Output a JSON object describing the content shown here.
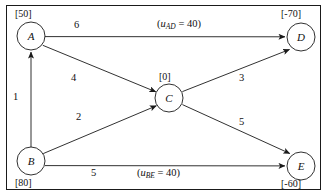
{
  "figure": {
    "border": true,
    "background": "#ffffff",
    "line_color": "#1a1a1a"
  },
  "nodes": [
    {
      "id": "A",
      "label": "A",
      "supply": "[50]",
      "supply_position": "above",
      "cx": 31,
      "cy": 36,
      "r": 14
    },
    {
      "id": "D",
      "label": "D",
      "supply": "[-70]",
      "supply_position": "above",
      "cx": 301,
      "cy": 37,
      "r": 14
    },
    {
      "id": "C",
      "label": "C",
      "supply": "[0]",
      "supply_position": "above",
      "cx": 169,
      "cy": 98,
      "r": 14
    },
    {
      "id": "B",
      "label": "B",
      "supply": "[80]",
      "supply_position": "below",
      "cx": 31,
      "cy": 161,
      "r": 14
    },
    {
      "id": "E",
      "label": "E",
      "supply": "[-60]",
      "supply_position": "below",
      "cx": 301,
      "cy": 166,
      "r": 14
    }
  ],
  "edges": [
    {
      "id": "AD",
      "from": "A",
      "to": "D",
      "cost": "6",
      "cost_x": 74,
      "cost_y": 20,
      "capacity_text": "(uAD = 40)",
      "capacity_x": 157,
      "capacity_y": 19
    },
    {
      "id": "AC",
      "from": "A",
      "to": "C",
      "cost": "4",
      "cost_x": 71,
      "cost_y": 73,
      "capacity_text": null
    },
    {
      "id": "BA",
      "from": "B",
      "to": "A",
      "cost": "1",
      "cost_x": 13,
      "cost_y": 92,
      "capacity_text": null
    },
    {
      "id": "BC",
      "from": "B",
      "to": "C",
      "cost": "2",
      "cost_x": 76,
      "cost_y": 112,
      "capacity_text": null
    },
    {
      "id": "CD",
      "from": "C",
      "to": "D",
      "cost": "3",
      "cost_x": 239,
      "cost_y": 73,
      "capacity_text": null
    },
    {
      "id": "CE",
      "from": "C",
      "to": "E",
      "cost": "5",
      "cost_x": 239,
      "cost_y": 117,
      "capacity_text": null
    },
    {
      "id": "BE",
      "from": "B",
      "to": "E",
      "cost": "5",
      "cost_x": 91,
      "cost_y": 167,
      "capacity_text": "(uBE = 40)",
      "capacity_x": 137,
      "capacity_y": 167
    }
  ],
  "capacity_labels": {
    "AD": {
      "prefix": "(",
      "symbol": "u",
      "sub": "AD",
      "equals": " = ",
      "value": "40",
      "suffix": ")"
    },
    "BE": {
      "prefix": "(",
      "symbol": "u",
      "sub": "BE",
      "equals": " = ",
      "value": "40",
      "suffix": ")"
    }
  },
  "supply_values": {
    "A": "[50]",
    "B": "[80]",
    "C": "[0]",
    "D": "[-70]",
    "E": "[-60]"
  },
  "node_letters": {
    "A": "A",
    "B": "B",
    "C": "C",
    "D": "D",
    "E": "E"
  },
  "costs": {
    "AD": "6",
    "AC": "4",
    "BA": "1",
    "BC": "2",
    "CD": "3",
    "CE": "5",
    "BE": "5"
  }
}
